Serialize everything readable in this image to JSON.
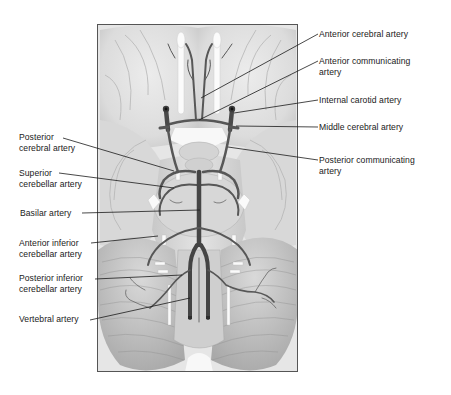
{
  "diagram": {
    "colors": {
      "background": "#ffffff",
      "frame_border": "#555555",
      "brain_fill": "#e2e2e2",
      "brain_shade": "#c9c9c9",
      "artery": "#5a5a5a",
      "artery_dark": "#3a3a3a",
      "nerve_white": "#fafafa",
      "leader_line": "#1a1a1a",
      "label_text": "#1a1a1a"
    },
    "frame": {
      "x": 97,
      "y": 24,
      "width": 201,
      "height": 348
    },
    "labels_right": [
      {
        "id": "anterior-cerebral-artery",
        "lines": [
          "Anterior cerebral artery"
        ],
        "x": 319,
        "y": 29,
        "anchor": [
          318,
          34
        ],
        "target": [
          201,
          98
        ]
      },
      {
        "id": "anterior-communicating-artery",
        "lines": [
          "Anterior communicating",
          "artery"
        ],
        "x": 319,
        "y": 56,
        "anchor": [
          318,
          61
        ],
        "target": [
          199,
          120
        ]
      },
      {
        "id": "internal-carotid-artery",
        "lines": [
          "Internal carotid artery"
        ],
        "x": 319,
        "y": 95,
        "anchor": [
          318,
          100
        ],
        "target": [
          234,
          113
        ]
      },
      {
        "id": "middle-cerebral-artery",
        "lines": [
          "Middle cerebral artery"
        ],
        "x": 319,
        "y": 122,
        "anchor": [
          318,
          127
        ],
        "target": [
          236,
          126
        ]
      },
      {
        "id": "posterior-communicating-artery",
        "lines": [
          "Posterior communicating",
          "artery"
        ],
        "x": 319,
        "y": 155,
        "anchor": [
          318,
          160
        ],
        "target": [
          228,
          147
        ]
      }
    ],
    "labels_left": [
      {
        "id": "posterior-cerebral-artery",
        "lines": [
          "Posterior",
          "cerebral artery"
        ],
        "x": 19,
        "y": 132,
        "anchor": [
          63,
          138
        ],
        "target": [
          174,
          171
        ]
      },
      {
        "id": "superior-cerebellar-artery",
        "lines": [
          "Superior",
          "cerebellar artery"
        ],
        "x": 19,
        "y": 168,
        "anchor": [
          59,
          173
        ],
        "target": [
          174,
          188
        ]
      },
      {
        "id": "basilar-artery",
        "lines": [
          "Basilar artery"
        ],
        "x": 20,
        "y": 208,
        "anchor": [
          82,
          213
        ],
        "target": [
          200,
          210
        ]
      },
      {
        "id": "anterior-inferior-cerebellar-artery",
        "lines": [
          "Anterior inferior",
          "cerebellar artery"
        ],
        "x": 19,
        "y": 238,
        "anchor": [
          91,
          243
        ],
        "target": [
          158,
          236
        ]
      },
      {
        "id": "posterior-inferior-cerebellar-artery",
        "lines": [
          "Posterior inferior",
          "cerebellar artery"
        ],
        "x": 19,
        "y": 273,
        "anchor": [
          95,
          279
        ],
        "target": [
          182,
          275
        ]
      },
      {
        "id": "vertebral-artery",
        "lines": [
          "Vertebral artery"
        ],
        "x": 19,
        "y": 314,
        "anchor": [
          90,
          320
        ],
        "target": [
          190,
          298
        ]
      }
    ]
  }
}
